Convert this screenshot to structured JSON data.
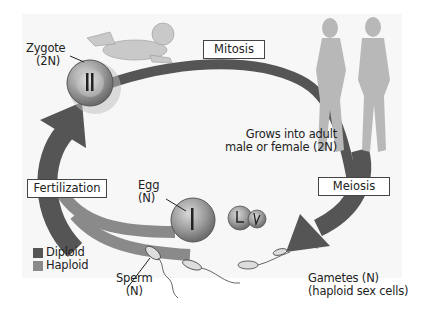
{
  "figure": {
    "stages": {
      "zygote": {
        "label_line1": "Zygote",
        "label_line2": "(2N)"
      },
      "mitosis": {
        "label": "Mitosis"
      },
      "adult": {
        "label_line1": "Grows into adult",
        "label_line2": "male or female (2N)"
      },
      "meiosis": {
        "label": "Meiosis"
      },
      "gametes": {
        "label_line1": "Gametes (N)",
        "label_line2": "(haploid sex cells)"
      },
      "sperm": {
        "label_line1": "Sperm",
        "label_line2": "(N)"
      },
      "egg": {
        "label_line1": "Egg",
        "label_line2": "(N)"
      },
      "fertilization": {
        "label": "Fertilization"
      }
    },
    "legend": [
      {
        "label": "Diploid",
        "color": "#555555"
      },
      {
        "label": "Haploid",
        "color": "#8a8a8a"
      }
    ],
    "colors": {
      "diploid_arrow": "#555555",
      "haploid_arrow": "#8a8a8a",
      "cell_fill": "#9a9a9a",
      "figure_fill": "#b8b8b8",
      "background": "#f7f7f7"
    }
  }
}
